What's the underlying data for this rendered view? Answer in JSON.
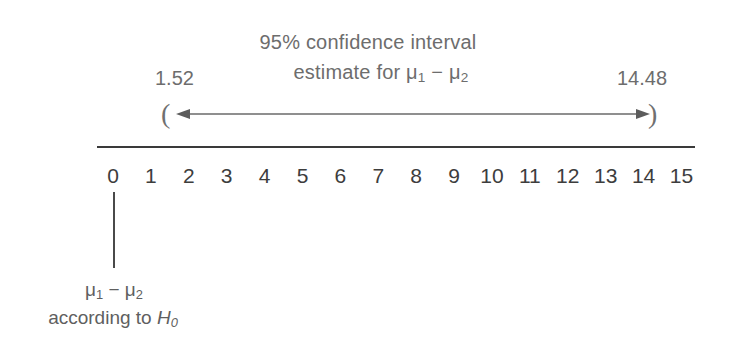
{
  "figure": {
    "title_line_1": "95% confidence interval",
    "title_line_2_prefix": "estimate for ",
    "title_line_2_expr_mu": "μ",
    "title_line_2_sub1": "1",
    "title_line_2_minus": " − ",
    "title_line_2_sub2": "2"
  },
  "interval": {
    "lower_bound_label": "1.52",
    "upper_bound_label": "14.48",
    "open_paren": "(",
    "close_paren": ")",
    "lower_bound_value": 1.52,
    "upper_bound_value": 14.48,
    "confidence_level": "95%"
  },
  "axis": {
    "tick_labels": [
      "0",
      "1",
      "2",
      "3",
      "4",
      "5",
      "6",
      "7",
      "8",
      "9",
      "10",
      "11",
      "12",
      "13",
      "14",
      "15"
    ],
    "min": 0,
    "max": 15
  },
  "null_marker": {
    "value": 0,
    "caption_mu": "μ",
    "caption_sub1": "1",
    "caption_minus": " − ",
    "caption_sub2": "2",
    "caption_line_2_prefix": "according to ",
    "caption_line_2_h": "H",
    "caption_line_2_sub": "0"
  },
  "chart_data": {
    "type": "line",
    "title": "95% confidence interval estimate for μ1 − μ2",
    "xlabel": "",
    "ylabel": "",
    "xlim": [
      0,
      15
    ],
    "grid": false,
    "legend": "none",
    "categories": [
      "0",
      "1",
      "2",
      "3",
      "4",
      "5",
      "6",
      "7",
      "8",
      "9",
      "10",
      "11",
      "12",
      "13",
      "14",
      "15"
    ],
    "annotations": [
      {
        "name": "confidence-interval",
        "kind": "interval-bar",
        "lower": 1.52,
        "upper": 14.48,
        "lower_label": "1.52",
        "upper_label": "14.48",
        "style": "double-headed-arrow-with-parentheses",
        "text": "95% confidence interval estimate for μ1 − μ2"
      },
      {
        "name": "null-hypothesis-marker",
        "kind": "vertical-tick",
        "x": 0,
        "text": "μ1 − μ2 according to H0"
      }
    ]
  },
  "colors": {
    "axis": "#3a3a3a",
    "tick_text": "#3d3d3d",
    "title_text": "#6d6d6d",
    "arrow": "#6a6a6a",
    "background": "#ffffff"
  }
}
